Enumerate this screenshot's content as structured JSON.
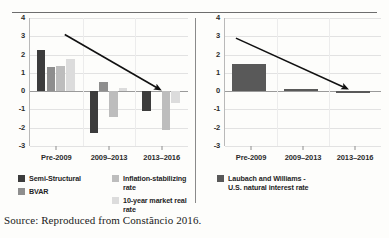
{
  "figure": {
    "source_caption": "Source: Reproduced from Constãncio 2016."
  },
  "chart_data": [
    {
      "type": "bar",
      "panel": "left",
      "title": "",
      "xlabel": "",
      "ylabel": "",
      "categories": [
        "Pre-2009",
        "2009–2013",
        "2013–2016"
      ],
      "ylim": [
        -3,
        4
      ],
      "yticks": [
        "4",
        "3",
        "2",
        "1",
        "0",
        "-1",
        "-2",
        "-3"
      ],
      "grid": true,
      "legend_position": "bottom",
      "series": [
        {
          "name": "Semi-Structural",
          "color": "#3c3c3c",
          "values": [
            2.25,
            -2.3,
            -1.1
          ]
        },
        {
          "name": "BVAR",
          "color": "#8e8e8e",
          "values": [
            1.3,
            0.5,
            null
          ]
        },
        {
          "name": "Inflation-stabilizing rate",
          "color": "#bdbdbd",
          "values": [
            1.35,
            -1.4,
            -2.1
          ]
        },
        {
          "name": "10-year market real rate",
          "color": "#dcdcdc",
          "values": [
            1.75,
            0.15,
            -0.65
          ]
        }
      ],
      "annotations": [
        {
          "type": "arrow",
          "label": "downward-trend-arrow",
          "from": [
            0.22,
            3.1
          ],
          "to": [
            0.82,
            0.1
          ]
        }
      ]
    },
    {
      "type": "bar",
      "panel": "right",
      "title": "",
      "xlabel": "",
      "ylabel": "",
      "categories": [
        "Pre-2009",
        "2009–2013",
        "2013–2016"
      ],
      "ylim": [
        -3,
        4
      ],
      "yticks": [
        "4",
        "3",
        "2",
        "1",
        "0",
        "-1",
        "-2",
        "-3"
      ],
      "grid": true,
      "legend_position": "bottom",
      "series": [
        {
          "name": "Laubach and Williams - U.S. natural interest rate",
          "color": "#595959",
          "values": [
            1.5,
            0.12,
            -0.12
          ]
        }
      ],
      "annotations": [
        {
          "type": "arrow",
          "label": "downward-trend-arrow",
          "from": [
            0.07,
            2.9
          ],
          "to": [
            0.78,
            0.15
          ]
        }
      ]
    }
  ],
  "legend_left": {
    "column1": [
      {
        "label": "Semi-Structural",
        "color": "#3c3c3c"
      },
      {
        "label": "BVAR",
        "color": "#8e8e8e"
      }
    ],
    "column2": [
      {
        "label": "Inflation-stabilizing rate",
        "color": "#bdbdbd"
      },
      {
        "label": "10-year market real rate",
        "color": "#dcdcdc"
      }
    ]
  },
  "legend_right": {
    "items": [
      {
        "label_line1": "Laubach and Williams -",
        "label_line2": "U.S. natural interest rate",
        "color": "#595959"
      }
    ]
  }
}
